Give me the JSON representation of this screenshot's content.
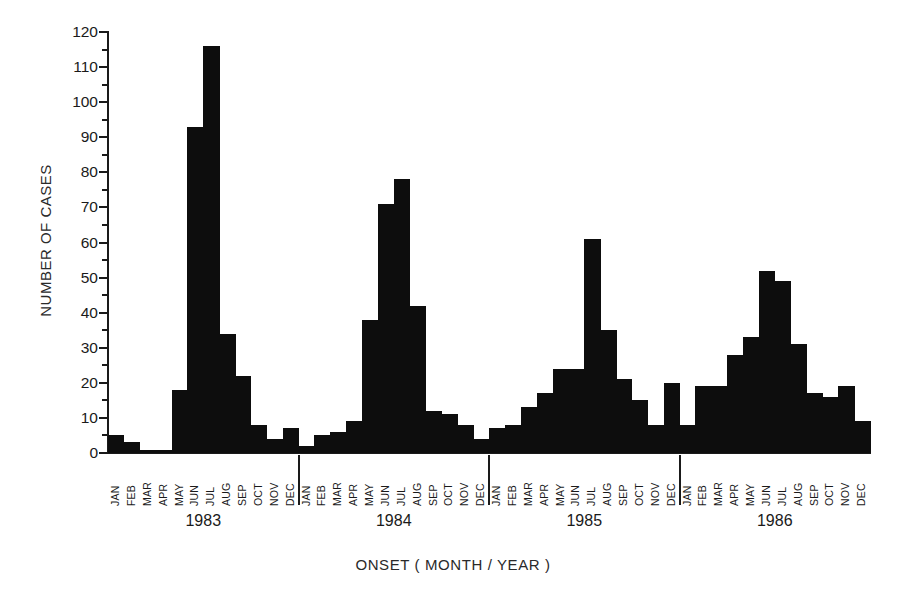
{
  "chart_data": {
    "type": "bar",
    "title": "",
    "xlabel": "ONSET ( MONTH / YEAR )",
    "ylabel": "NUMBER OF CASES",
    "ylim": [
      0,
      120
    ],
    "ytick_step": 10,
    "yminor_step": 5,
    "grid": false,
    "legend": null,
    "bar_color": "#0d0d0d",
    "yticks": [
      0,
      10,
      20,
      30,
      40,
      50,
      60,
      70,
      80,
      90,
      100,
      110,
      120
    ],
    "month_labels": [
      "JAN",
      "FEB",
      "MAR",
      "APR",
      "MAY",
      "JUN",
      "JUL",
      "AUG",
      "SEP",
      "OCT",
      "NOV",
      "DEC"
    ],
    "years": [
      "1983",
      "1984",
      "1985",
      "1986"
    ],
    "categories": [
      "JAN 1983",
      "FEB 1983",
      "MAR 1983",
      "APR 1983",
      "MAY 1983",
      "JUN 1983",
      "JUL 1983",
      "AUG 1983",
      "SEP 1983",
      "OCT 1983",
      "NOV 1983",
      "DEC 1983",
      "JAN 1984",
      "FEB 1984",
      "MAR 1984",
      "APR 1984",
      "MAY 1984",
      "JUN 1984",
      "JUL 1984",
      "AUG 1984",
      "SEP 1984",
      "OCT 1984",
      "NOV 1984",
      "DEC 1984",
      "JAN 1985",
      "FEB 1985",
      "MAR 1985",
      "APR 1985",
      "MAY 1985",
      "JUN 1985",
      "JUL 1985",
      "AUG 1985",
      "SEP 1985",
      "OCT 1985",
      "NOV 1985",
      "DEC 1985",
      "JAN 1986",
      "FEB 1986",
      "MAR 1986",
      "APR 1986",
      "MAY 1986",
      "JUN 1986",
      "JUL 1986",
      "AUG 1986",
      "SEP 1986",
      "OCT 1986",
      "NOV 1986",
      "DEC 1986"
    ],
    "values": [
      5,
      3,
      1,
      1,
      18,
      93,
      116,
      34,
      22,
      8,
      4,
      7,
      2,
      5,
      6,
      9,
      38,
      71,
      78,
      42,
      12,
      11,
      8,
      4,
      7,
      8,
      13,
      17,
      24,
      24,
      61,
      35,
      21,
      15,
      8,
      20,
      8,
      19,
      19,
      28,
      33,
      52,
      49,
      31,
      17,
      16,
      19,
      9
    ]
  }
}
